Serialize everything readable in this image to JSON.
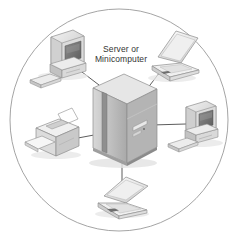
{
  "diagram": {
    "boundary": {
      "shape": "circle",
      "stroke_color": "#9a9a9a",
      "fill_color": "#ffffff"
    },
    "background_color": "#ffffff",
    "link_color": "#4a4a4a",
    "center_label": {
      "line1": "Server or",
      "line2": "Minicomputer",
      "color": "#333333"
    },
    "nodes": [
      {
        "id": "server",
        "label": "Server or Minicomputer",
        "icon": "server-tower-icon",
        "position": "center"
      },
      {
        "id": "desktop-top-left",
        "label": "Desktop computer",
        "icon": "desktop-computer-icon",
        "position": "top-left"
      },
      {
        "id": "laptop-top-right",
        "label": "Laptop computer",
        "icon": "laptop-icon",
        "position": "top-right"
      },
      {
        "id": "desktop-right",
        "label": "Desktop computer",
        "icon": "desktop-computer-icon",
        "position": "right"
      },
      {
        "id": "printer-left",
        "label": "Printer",
        "icon": "printer-icon",
        "position": "left"
      },
      {
        "id": "laptop-bottom",
        "label": "Laptop computer",
        "icon": "laptop-icon",
        "position": "bottom"
      }
    ],
    "links": [
      {
        "from": "desktop-top-left",
        "to": "server"
      },
      {
        "from": "laptop-top-right",
        "to": "server"
      },
      {
        "from": "desktop-right",
        "to": "server"
      },
      {
        "from": "printer-left",
        "to": "server"
      },
      {
        "from": "laptop-bottom",
        "to": "server"
      }
    ]
  }
}
